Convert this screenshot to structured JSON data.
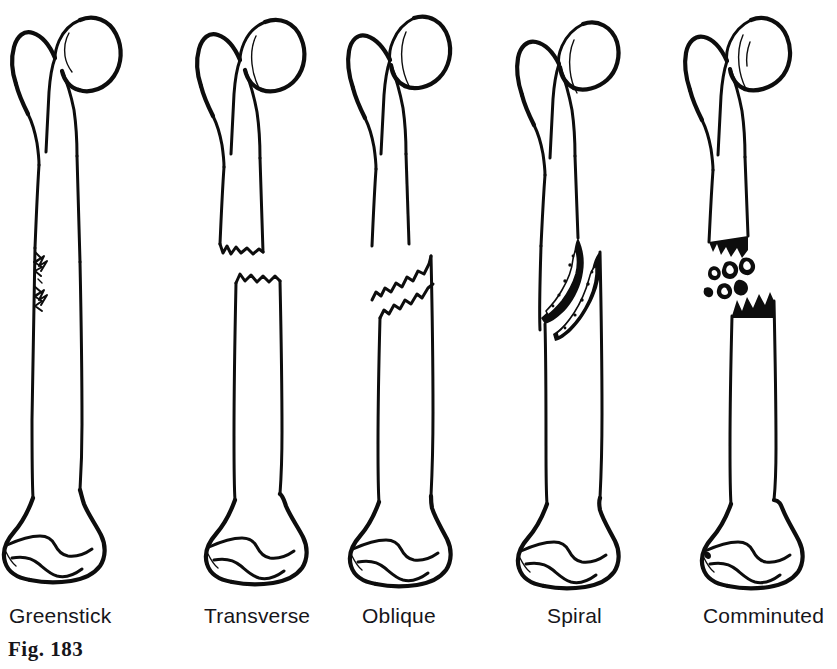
{
  "figure": {
    "caption": "Fig.  183",
    "background_color": "#ffffff",
    "ink_color": "#0d0d0d"
  },
  "labels": [
    {
      "id": "greenstick",
      "text": "Greenstick",
      "left": 9,
      "column_left": -8
    },
    {
      "id": "transverse",
      "text": "Transverse",
      "left": 204,
      "column_left": 173
    },
    {
      "id": "oblique",
      "text": "Oblique",
      "left": 362,
      "column_left": 318
    },
    {
      "id": "spiral",
      "text": "Spiral",
      "left": 547,
      "column_left": 488
    },
    {
      "id": "comminuted",
      "text": "Comminuted",
      "left": 703,
      "column_left": 658
    }
  ]
}
